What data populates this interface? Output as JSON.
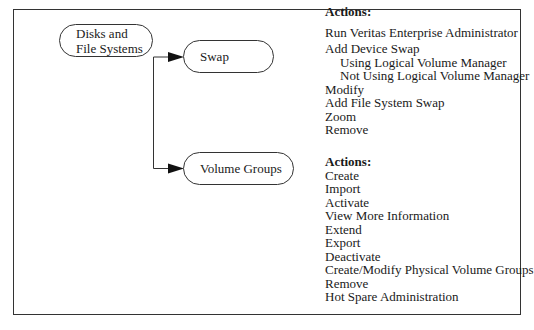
{
  "diagram": {
    "nodes": {
      "root": {
        "label_line1": "Disks and",
        "label_line2": "File Systems"
      },
      "swap": {
        "label": "Swap"
      },
      "volume_groups": {
        "label": "Volume Groups"
      }
    },
    "edges": [
      {
        "from": "Disks and File Systems",
        "to": "Swap"
      },
      {
        "from": "Disks and File Systems",
        "to": "Volume Groups"
      }
    ],
    "swap_actions": {
      "heading": "Actions:",
      "items": [
        {
          "label": "Run Veritas Enterprise Administrator",
          "indent": false
        },
        {
          "label": "Add Device Swap",
          "indent": false
        },
        {
          "label": "Using Logical Volume Manager",
          "indent": true
        },
        {
          "label": "Not Using Logical Volume Manager",
          "indent": true
        },
        {
          "label": "Modify",
          "indent": false
        },
        {
          "label": "Add File System Swap",
          "indent": false
        },
        {
          "label": "Zoom",
          "indent": false
        },
        {
          "label": "Remove",
          "indent": false
        }
      ]
    },
    "volume_group_actions": {
      "heading": "Actions:",
      "items": [
        {
          "label": "Create"
        },
        {
          "label": "Import"
        },
        {
          "label": "Activate"
        },
        {
          "label": "View More Information"
        },
        {
          "label": "Extend"
        },
        {
          "label": "Export"
        },
        {
          "label": "Deactivate"
        },
        {
          "label": "Create/Modify Physical Volume Groups"
        },
        {
          "label": "Remove"
        },
        {
          "label": "Hot Spare Administration"
        }
      ]
    },
    "colors": {
      "line": "#333333",
      "text": "#1a1a1a",
      "background": "#ffffff"
    }
  }
}
